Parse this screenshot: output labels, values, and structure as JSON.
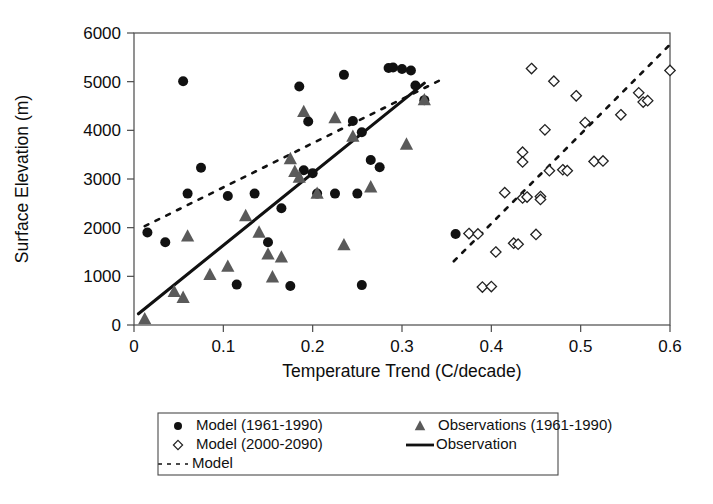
{
  "chart_data": {
    "type": "scatter",
    "title": "",
    "xlabel": "Temperature Trend (C/decade)",
    "ylabel": "Surface Elevation (m)",
    "xlim": [
      0,
      0.6
    ],
    "ylim": [
      0,
      6000
    ],
    "xticks": [
      "0",
      "0.1",
      "0.2",
      "0.3",
      "0.4",
      "0.5",
      "0.6"
    ],
    "xtick_values": [
      0,
      0.1,
      0.2,
      0.3,
      0.4,
      0.5,
      0.6
    ],
    "yticks": [
      "0",
      "1000",
      "2000",
      "3000",
      "4000",
      "5000",
      "6000"
    ],
    "ytick_values": [
      0,
      1000,
      2000,
      3000,
      4000,
      5000,
      6000
    ],
    "grid": false,
    "legend_position": "below",
    "series": [
      {
        "name": "Model (1961-1990)",
        "marker": "filled-circle",
        "color": "#111111",
        "points": [
          [
            0.015,
            1900
          ],
          [
            0.035,
            1700
          ],
          [
            0.055,
            5010
          ],
          [
            0.06,
            2700
          ],
          [
            0.075,
            3230
          ],
          [
            0.105,
            2650
          ],
          [
            0.115,
            830
          ],
          [
            0.135,
            2700
          ],
          [
            0.15,
            1700
          ],
          [
            0.165,
            2400
          ],
          [
            0.175,
            800
          ],
          [
            0.185,
            4900
          ],
          [
            0.19,
            3180
          ],
          [
            0.195,
            4180
          ],
          [
            0.2,
            3120
          ],
          [
            0.205,
            2700
          ],
          [
            0.225,
            2700
          ],
          [
            0.235,
            5140
          ],
          [
            0.245,
            4190
          ],
          [
            0.25,
            2700
          ],
          [
            0.255,
            3960
          ],
          [
            0.255,
            820
          ],
          [
            0.265,
            3390
          ],
          [
            0.275,
            3240
          ],
          [
            0.285,
            5280
          ],
          [
            0.29,
            5290
          ],
          [
            0.3,
            5260
          ],
          [
            0.31,
            5230
          ],
          [
            0.315,
            4920
          ],
          [
            0.325,
            4620
          ],
          [
            0.36,
            1870
          ]
        ]
      },
      {
        "name": "Observations (1961-1990)",
        "marker": "filled-triangle",
        "color": "#5a5a5a",
        "points": [
          [
            0.012,
            120
          ],
          [
            0.045,
            680
          ],
          [
            0.055,
            560
          ],
          [
            0.06,
            1820
          ],
          [
            0.085,
            1030
          ],
          [
            0.105,
            1200
          ],
          [
            0.125,
            2240
          ],
          [
            0.14,
            1900
          ],
          [
            0.15,
            1450
          ],
          [
            0.155,
            980
          ],
          [
            0.165,
            1390
          ],
          [
            0.175,
            3410
          ],
          [
            0.18,
            3150
          ],
          [
            0.185,
            3030
          ],
          [
            0.19,
            4380
          ],
          [
            0.205,
            2700
          ],
          [
            0.225,
            4250
          ],
          [
            0.235,
            1640
          ],
          [
            0.245,
            3870
          ],
          [
            0.265,
            2830
          ],
          [
            0.305,
            3710
          ],
          [
            0.325,
            4620
          ]
        ]
      },
      {
        "name": "Model (2000-2090)",
        "marker": "open-diamond",
        "color": "#222222",
        "points": [
          [
            0.375,
            1880
          ],
          [
            0.385,
            1870
          ],
          [
            0.39,
            780
          ],
          [
            0.4,
            790
          ],
          [
            0.405,
            1500
          ],
          [
            0.415,
            2720
          ],
          [
            0.425,
            1680
          ],
          [
            0.43,
            1660
          ],
          [
            0.435,
            2610
          ],
          [
            0.435,
            3550
          ],
          [
            0.435,
            3350
          ],
          [
            0.44,
            2630
          ],
          [
            0.445,
            5270
          ],
          [
            0.45,
            1860
          ],
          [
            0.455,
            2640
          ],
          [
            0.455,
            2580
          ],
          [
            0.46,
            4010
          ],
          [
            0.465,
            3170
          ],
          [
            0.47,
            5010
          ],
          [
            0.48,
            3190
          ],
          [
            0.485,
            3170
          ],
          [
            0.495,
            4710
          ],
          [
            0.505,
            4160
          ],
          [
            0.515,
            3360
          ],
          [
            0.525,
            3370
          ],
          [
            0.545,
            4320
          ],
          [
            0.565,
            4770
          ],
          [
            0.57,
            4580
          ],
          [
            0.575,
            4610
          ],
          [
            0.6,
            5230
          ]
        ]
      }
    ],
    "trendlines": [
      {
        "name": "Observation",
        "style": "solid",
        "color": "#111111",
        "start": [
          0.005,
          230
        ],
        "end": [
          0.325,
          4970
        ]
      },
      {
        "name": "Model",
        "style": "dashed",
        "color": "#111111",
        "start": [
          0.012,
          2030
        ],
        "end": [
          0.345,
          5050
        ]
      },
      {
        "name": "Model",
        "style": "dashed",
        "color": "#111111",
        "start": [
          0.358,
          1310
        ],
        "end": [
          0.602,
          5800
        ]
      }
    ]
  },
  "legend": {
    "entries": [
      {
        "label": "Model (1961-1990)",
        "marker": "filled-circle"
      },
      {
        "label": "Observations (1961-1990)",
        "marker": "filled-triangle"
      },
      {
        "label": "Model (2000-2090)",
        "marker": "open-diamond"
      },
      {
        "label": "Observation",
        "marker": "solid-line"
      },
      {
        "label": "Model",
        "marker": "dashed-line"
      }
    ]
  }
}
